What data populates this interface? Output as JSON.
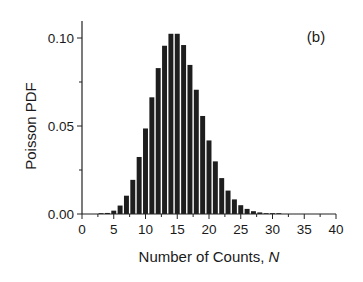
{
  "chart_data": {
    "type": "bar",
    "title": "",
    "panel_label": "(b)",
    "xlabel": "Number of Counts, ",
    "xlabel_italic": "N",
    "ylabel": "Poisson PDF",
    "xlim": [
      0,
      40
    ],
    "ylim": [
      0,
      0.105
    ],
    "grid": false,
    "legend": null,
    "x_ticks": [
      0,
      5,
      10,
      15,
      20,
      25,
      30,
      35,
      40
    ],
    "x_tick_labels": [
      "0",
      "5",
      "10",
      "15",
      "20",
      "25",
      "30",
      "35",
      "40"
    ],
    "y_ticks": [
      0.0,
      0.05,
      0.1
    ],
    "y_tick_labels": [
      "0.00",
      "0.05",
      "0.10"
    ],
    "bar_color": "#1e1e1e",
    "x": [
      0,
      1,
      2,
      3,
      4,
      5,
      6,
      7,
      8,
      9,
      10,
      11,
      12,
      13,
      14,
      15,
      16,
      17,
      18,
      19,
      20,
      21,
      22,
      23,
      24,
      25,
      26,
      27,
      28,
      29,
      30,
      31,
      32,
      33,
      34,
      35,
      36,
      37,
      38,
      39,
      40
    ],
    "values": [
      0.0,
      0.0,
      0.0,
      0.0002,
      0.0006,
      0.0019,
      0.0048,
      0.0104,
      0.0194,
      0.0324,
      0.0486,
      0.0663,
      0.0829,
      0.0956,
      0.1024,
      0.1024,
      0.096,
      0.0847,
      0.0706,
      0.0557,
      0.0418,
      0.0299,
      0.0204,
      0.0133,
      0.0083,
      0.005,
      0.0029,
      0.0016,
      0.0009,
      0.0004,
      0.0002,
      0.0001,
      0.0,
      0.0,
      0.0,
      0.0,
      0.0,
      0.0,
      0.0,
      0.0,
      0.0
    ]
  }
}
